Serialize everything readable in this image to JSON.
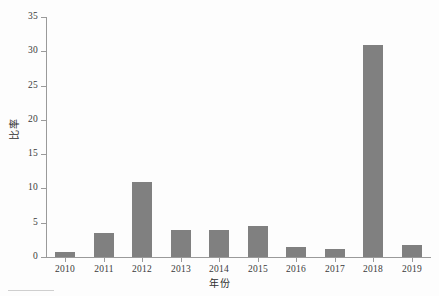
{
  "chart_data": {
    "type": "bar",
    "title": "",
    "xlabel": "年份",
    "ylabel": "比率",
    "categories": [
      "2010",
      "2011",
      "2012",
      "2013",
      "2014",
      "2015",
      "2016",
      "2017",
      "2018",
      "2019"
    ],
    "values": [
      0.7,
      3.5,
      10.9,
      4.0,
      3.9,
      4.5,
      1.5,
      1.2,
      30.9,
      1.7
    ],
    "series": [
      {
        "name": "比率",
        "values": [
          0.7,
          3.5,
          10.9,
          4.0,
          3.9,
          4.5,
          1.5,
          1.2,
          30.9,
          1.7
        ]
      }
    ],
    "ylim": [
      0,
      35
    ],
    "yticks": [
      0,
      5,
      10,
      15,
      20,
      25,
      30,
      35
    ],
    "ytick_labels": [
      "0",
      "5",
      "10",
      "15",
      "20",
      "25",
      "30",
      "35"
    ],
    "grid": false,
    "legend": false,
    "legend_position": "none",
    "bar_color": "#808080",
    "axis_color": "#9a9a9a",
    "text_color": "#3a3a3a"
  },
  "axes": {
    "y_title": "比率",
    "x_title": "年份"
  }
}
